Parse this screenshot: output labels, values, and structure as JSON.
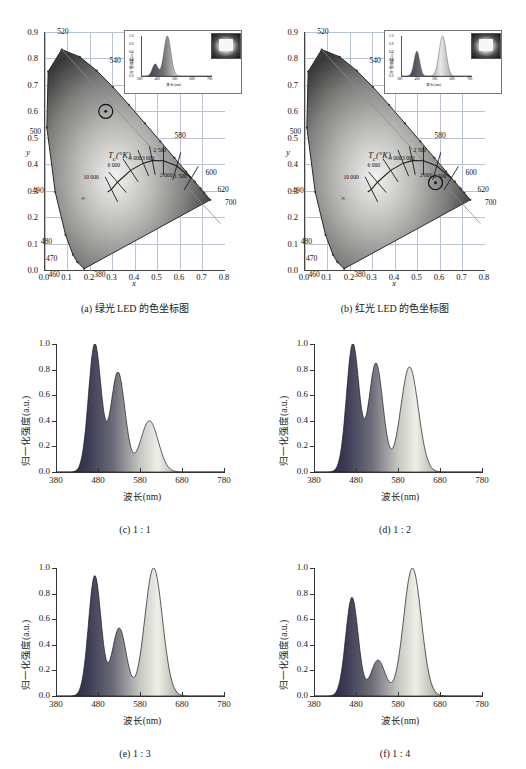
{
  "figure": {
    "panels": [
      {
        "id": "a",
        "caption": "(a) 绿光 LED 的色坐标图",
        "type": "cie"
      },
      {
        "id": "b",
        "caption": "(b) 红光 LED 的色坐标图",
        "type": "cie"
      },
      {
        "id": "c",
        "caption": "(c) 1 : 1",
        "type": "spectrum"
      },
      {
        "id": "d",
        "caption": "(d) 1 : 2",
        "type": "spectrum"
      },
      {
        "id": "e",
        "caption": "(e) 1 : 3",
        "type": "spectrum"
      },
      {
        "id": "f",
        "caption": "(f) 1 : 4",
        "type": "spectrum"
      }
    ]
  },
  "cie_common": {
    "xlabel": "x",
    "ylabel": "y",
    "xticks": [
      "0.0",
      "0.1",
      "0.2",
      "0.3",
      "0.4",
      "0.5",
      "0.6",
      "0.7",
      "0.8"
    ],
    "yticks": [
      "0.0",
      "0.1",
      "0.2",
      "0.3",
      "0.4",
      "0.5",
      "0.6",
      "0.7",
      "0.8",
      "0.9"
    ],
    "xlim": [
      0.0,
      0.8
    ],
    "ylim": [
      0.0,
      0.9
    ],
    "locus_labels": [
      "520",
      "540",
      "500",
      "580",
      "600",
      "620",
      "700",
      "490",
      "480",
      "470",
      "460",
      "380"
    ],
    "planck_title": "T<sub>c</sub>(°K)",
    "planck_title_text": "T (°K)",
    "planck_labels": [
      "10 000",
      "6 000",
      "4 000",
      "3 000",
      "2 500",
      "2 000",
      "1 500",
      "∞"
    ],
    "grid": true
  },
  "chart_data": [
    {
      "type": "scatter",
      "panel": "a",
      "title": "(a) 绿光 LED 的色坐标图",
      "xlabel": "x",
      "ylabel": "y",
      "xlim": [
        0.0,
        0.8
      ],
      "ylim": [
        0.0,
        0.9
      ],
      "points": [
        {
          "name": "绿光 LED 色坐标",
          "x": 0.27,
          "y": 0.6,
          "marker": "circle"
        }
      ],
      "grid": true,
      "inset": {
        "type": "line",
        "xlabel": "波长(nm)",
        "ylabel": "归一化强度(a.u.)",
        "xticks": [
          "380",
          "480",
          "580",
          "680",
          "780"
        ],
        "yticks": [
          "0.0",
          "0.2",
          "0.4",
          "0.6",
          "0.8",
          "1.0"
        ],
        "xlim": [
          380,
          780
        ],
        "ylim": [
          0,
          1.0
        ],
        "peaks": [
          {
            "wavelength": 455,
            "intensity": 0.3
          },
          {
            "wavelength": 525,
            "intensity": 1.0
          }
        ]
      }
    },
    {
      "type": "scatter",
      "panel": "b",
      "title": "(b) 红光 LED 的色坐标图",
      "xlabel": "x",
      "ylabel": "y",
      "xlim": [
        0.0,
        0.8
      ],
      "ylim": [
        0.0,
        0.9
      ],
      "points": [
        {
          "name": "红光 LED 色坐标",
          "x": 0.58,
          "y": 0.33,
          "marker": "circle"
        }
      ],
      "grid": true,
      "inset": {
        "type": "line",
        "xlabel": "波长(nm)",
        "ylabel": "归一化强度(a.u.)",
        "xticks": [
          "380",
          "480",
          "580",
          "680",
          "780"
        ],
        "yticks": [
          "0.0",
          "0.2",
          "0.4",
          "0.6",
          "0.8",
          "1.0"
        ],
        "xlim": [
          380,
          780
        ],
        "ylim": [
          0,
          1.0
        ],
        "peaks": [
          {
            "wavelength": 465,
            "intensity": 0.62
          },
          {
            "wavelength": 612,
            "intensity": 1.0
          }
        ]
      }
    },
    {
      "type": "area",
      "panel": "c",
      "title": "(c) 1 : 1",
      "xlabel": "波长(nm)",
      "ylabel": "归一化强度(a.u.)",
      "xticks": [
        "380",
        "480",
        "580",
        "680",
        "780"
      ],
      "yticks": [
        "0.0",
        "0.2",
        "0.4",
        "0.6",
        "0.8",
        "1.0"
      ],
      "xlim": [
        380,
        780
      ],
      "ylim": [
        0,
        1.0
      ],
      "peaks": [
        {
          "wavelength": 470,
          "intensity": 1.0
        },
        {
          "wavelength": 525,
          "intensity": 0.78
        },
        {
          "wavelength": 600,
          "intensity": 0.4
        }
      ],
      "valleys": [
        {
          "wavelength": 500,
          "intensity": 0.63
        },
        {
          "wavelength": 565,
          "intensity": 0.24
        }
      ]
    },
    {
      "type": "area",
      "panel": "d",
      "title": "(d) 1 : 2",
      "xlabel": "波长(nm)",
      "ylabel": "归一化强度(a.u.)",
      "xticks": [
        "380",
        "480",
        "580",
        "680",
        "780"
      ],
      "yticks": [
        "0.0",
        "0.2",
        "0.4",
        "0.6",
        "0.8",
        "1.0"
      ],
      "xlim": [
        380,
        780
      ],
      "ylim": [
        0,
        1.0
      ],
      "peaks": [
        {
          "wavelength": 470,
          "intensity": 1.0
        },
        {
          "wavelength": 525,
          "intensity": 0.85
        },
        {
          "wavelength": 605,
          "intensity": 0.82
        }
      ],
      "valleys": [
        {
          "wavelength": 497,
          "intensity": 0.65
        },
        {
          "wavelength": 565,
          "intensity": 0.32
        }
      ]
    },
    {
      "type": "area",
      "panel": "e",
      "title": "(e) 1 : 3",
      "xlabel": "波长(nm)",
      "ylabel": "归一化强度(a.u.)",
      "xticks": [
        "380",
        "480",
        "580",
        "680",
        "780"
      ],
      "yticks": [
        "0.0",
        "0.2",
        "0.4",
        "0.6",
        "0.8",
        "1.0"
      ],
      "xlim": [
        380,
        780
      ],
      "ylim": [
        0,
        1.0
      ],
      "peaks": [
        {
          "wavelength": 470,
          "intensity": 0.94
        },
        {
          "wavelength": 528,
          "intensity": 0.53
        },
        {
          "wavelength": 610,
          "intensity": 1.0
        }
      ],
      "valleys": [
        {
          "wavelength": 505,
          "intensity": 0.47
        },
        {
          "wavelength": 563,
          "intensity": 0.23
        }
      ]
    },
    {
      "type": "area",
      "panel": "f",
      "title": "(f) 1 : 4",
      "xlabel": "波长(nm)",
      "ylabel": "归一化强度(a.u.)",
      "xticks": [
        "380",
        "480",
        "580",
        "680",
        "780"
      ],
      "yticks": [
        "0.0",
        "0.2",
        "0.4",
        "0.6",
        "0.8",
        "1.0"
      ],
      "xlim": [
        380,
        780
      ],
      "ylim": [
        0,
        1.0
      ],
      "peaks": [
        {
          "wavelength": 468,
          "intensity": 0.77
        },
        {
          "wavelength": 530,
          "intensity": 0.28
        },
        {
          "wavelength": 612,
          "intensity": 1.0
        }
      ],
      "valleys": [
        {
          "wavelength": 505,
          "intensity": 0.26
        },
        {
          "wavelength": 560,
          "intensity": 0.09
        }
      ]
    }
  ]
}
